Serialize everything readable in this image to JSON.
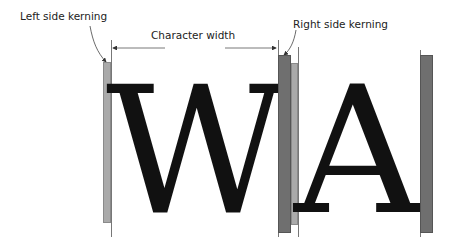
{
  "labels": {
    "left_kerning": "Left side kerning",
    "char_width": "Character width",
    "right_kerning": "Right side kerning"
  },
  "glyphs": {
    "first": "W",
    "second": "A"
  },
  "colors": {
    "light_bar": "#aaaaaa",
    "dark_bar": "#6f6f6f",
    "glyph": "#111111",
    "guide_line": "#777777",
    "arrow": "#333333"
  }
}
